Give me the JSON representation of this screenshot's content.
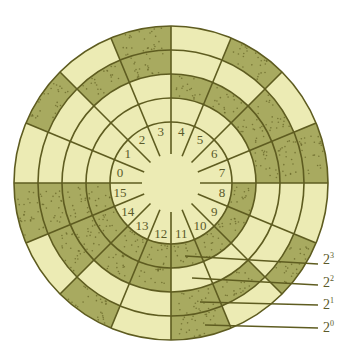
{
  "colors": {
    "light": "#ecebb4",
    "dark": "#a8aa60",
    "line": "#5e5c20",
    "dot": "#6b6a2c",
    "label": "#5a5a2a"
  },
  "geometry": {
    "cx": 171,
    "cy": 183,
    "hub_radius": 29,
    "ring_radii": [
      61,
      85,
      109,
      133,
      157
    ],
    "sector_count": 16
  },
  "sectors": [
    "0",
    "1",
    "2",
    "3",
    "4",
    "5",
    "6",
    "7",
    "8",
    "9",
    "10",
    "11",
    "12",
    "13",
    "14",
    "15"
  ],
  "rings": [
    {
      "bit": 3,
      "label": "2",
      "exp": "3",
      "position": "innermost"
    },
    {
      "bit": 2,
      "label": "2",
      "exp": "2",
      "position": "second"
    },
    {
      "bit": 1,
      "label": "2",
      "exp": "1",
      "position": "third"
    },
    {
      "bit": 0,
      "label": "2",
      "exp": "0",
      "position": "outermost"
    }
  ],
  "leaders": [
    {
      "label": "2",
      "exp": "3",
      "x1": 185,
      "y1": 256,
      "x2": 318,
      "y2": 264,
      "lx": 323,
      "ly": 252
    },
    {
      "label": "2",
      "exp": "2",
      "x1": 192,
      "y1": 278,
      "x2": 318,
      "y2": 285,
      "lx": 323,
      "ly": 275
    },
    {
      "label": "2",
      "exp": "1",
      "x1": 200,
      "y1": 302,
      "x2": 318,
      "y2": 305,
      "lx": 323,
      "ly": 297
    },
    {
      "label": "2",
      "exp": "0",
      "x1": 205,
      "y1": 325,
      "x2": 318,
      "y2": 328,
      "lx": 323,
      "ly": 320
    }
  ]
}
